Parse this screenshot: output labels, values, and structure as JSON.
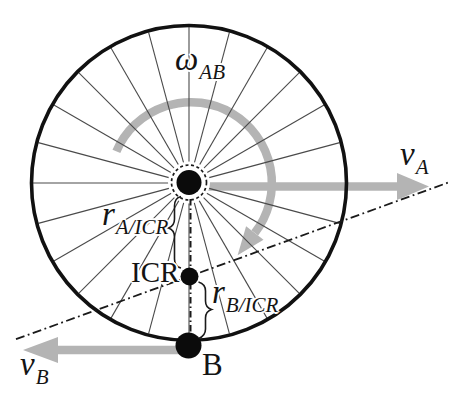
{
  "figure": {
    "kind": "instantaneous-center-of-rotation-wheel-diagram"
  },
  "labels": {
    "omega_ab": {
      "base": "ω",
      "sub": "AB"
    },
    "v_a": {
      "base": "v",
      "sub": "A"
    },
    "v_b": {
      "base": "v",
      "sub": "B"
    },
    "r_a_icr": {
      "base": "r",
      "sub": "A/ICR"
    },
    "r_b_icr": {
      "base": "r",
      "sub": "B/ICR"
    },
    "point_icr": "ICR",
    "point_b": "B"
  },
  "colors": {
    "arrow_gray": "#b4b4b4",
    "line_black": "#141414",
    "background": "#ffffff"
  }
}
